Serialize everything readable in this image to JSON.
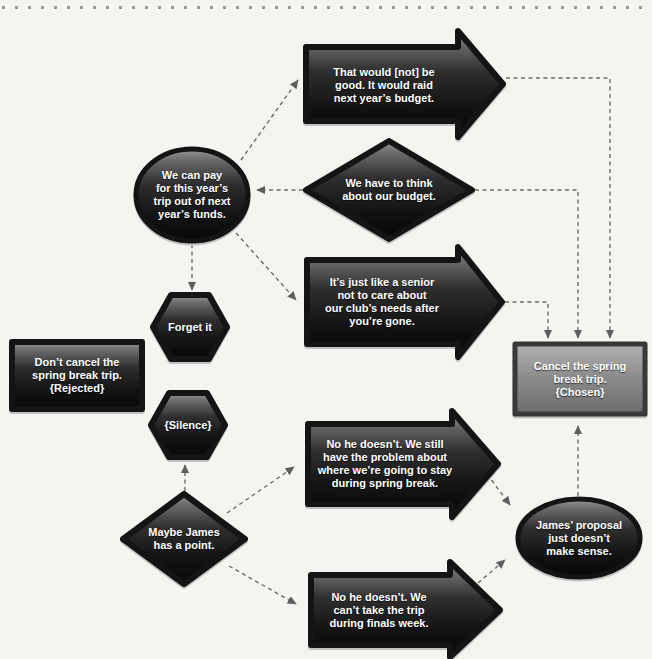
{
  "colors": {
    "background": "#f5f4f1",
    "shape_dark_top": "#989898",
    "shape_dark_bottom": "#060606",
    "shape_border": "#141414",
    "chosen_fill_top": "#b2b2b2",
    "chosen_fill_bottom": "#6b6b6b",
    "connector": "#6b6b6b",
    "label_text": "#ffffff",
    "edge_dots": "#979797"
  },
  "nodes": [
    {
      "id": "that-would-not-be-good",
      "shape": "block-arrow",
      "label": "That would [not] be\ngood. It would raid\nnext year’s budget."
    },
    {
      "id": "we-can-pay",
      "shape": "ellipse",
      "label": "We can pay\nfor this year’s\ntrip out of next\nyear’s funds."
    },
    {
      "id": "we-have-to-think",
      "shape": "diamond",
      "label": "We have to think\nabout our budget."
    },
    {
      "id": "its-just-like-a-senior",
      "shape": "block-arrow",
      "label": "It’s just like a senior\nnot to care about\nour club’s needs after\nyou’re gone."
    },
    {
      "id": "forget-it",
      "shape": "hexagon",
      "label": "Forget it"
    },
    {
      "id": "dont-cancel-rejected",
      "shape": "rectangle",
      "label": "Don’t cancel the\nspring break trip.\n{Rejected}"
    },
    {
      "id": "silence",
      "shape": "hexagon",
      "label": "{Silence}"
    },
    {
      "id": "cancel-chosen",
      "shape": "rectangle",
      "label": "Cancel the spring\nbreak trip.\n{Chosen}"
    },
    {
      "id": "no-he-doesnt-still",
      "shape": "block-arrow",
      "label": "No he doesn’t. We still\nhave the problem about\nwhere we’re going to stay\nduring spring break."
    },
    {
      "id": "maybe-james",
      "shape": "diamond",
      "label": "Maybe James\nhas a point."
    },
    {
      "id": "no-he-doesnt-finals",
      "shape": "block-arrow",
      "label": "No he doesn’t. We\ncan’t take the trip\nduring finals week."
    },
    {
      "id": "james-proposal",
      "shape": "ellipse",
      "label": "James’ proposal\njust doesn’t\nmake sense."
    }
  ],
  "edges": [
    {
      "from": "we-can-pay",
      "to": "that-would-not-be-good"
    },
    {
      "from": "we-can-pay",
      "to": "forget-it"
    },
    {
      "from": "we-can-pay",
      "to": "its-just-like-a-senior"
    },
    {
      "from": "we-have-to-think",
      "to": "we-can-pay"
    },
    {
      "from": "that-would-not-be-good",
      "to": "cancel-chosen"
    },
    {
      "from": "we-have-to-think",
      "to": "cancel-chosen"
    },
    {
      "from": "its-just-like-a-senior",
      "to": "cancel-chosen"
    },
    {
      "from": "maybe-james",
      "to": "silence"
    },
    {
      "from": "maybe-james",
      "to": "no-he-doesnt-still"
    },
    {
      "from": "maybe-james",
      "to": "no-he-doesnt-finals"
    },
    {
      "from": "no-he-doesnt-still",
      "to": "james-proposal"
    },
    {
      "from": "no-he-doesnt-finals",
      "to": "james-proposal"
    },
    {
      "from": "james-proposal",
      "to": "cancel-chosen"
    }
  ]
}
